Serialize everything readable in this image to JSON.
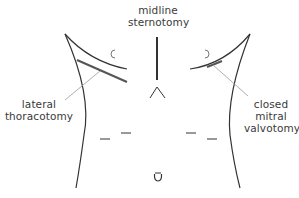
{
  "diagram": {
    "labels": {
      "midline": [
        "midline",
        "sternotomy"
      ],
      "lateral": [
        "lateral",
        "thoracotomy"
      ],
      "closed": [
        "closed",
        "mitral",
        "valvotomy"
      ]
    },
    "colors": {
      "outline": "#333333",
      "incision": "#555555",
      "leader": "#9a9a9a",
      "text": "#3a3a3a",
      "background": "#ffffff"
    },
    "features": [
      "torso-outline",
      "nipples",
      "midline-sternotomy-incision",
      "lateral-thoracotomy-incision",
      "closed-mitral-valvotomy-incision",
      "costal-margin-marks",
      "umbilicus"
    ]
  }
}
